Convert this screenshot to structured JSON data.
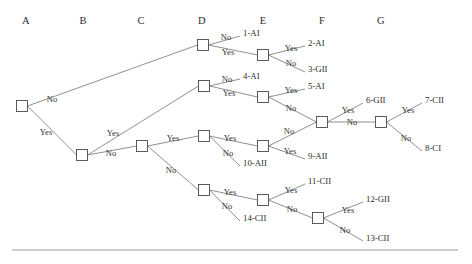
{
  "diagram": {
    "columns": [
      {
        "id": "A",
        "label": "A",
        "x": 26
      },
      {
        "id": "B",
        "label": "B",
        "x": 83
      },
      {
        "id": "C",
        "label": "C",
        "x": 141
      },
      {
        "id": "D",
        "label": "D",
        "x": 202
      },
      {
        "id": "E",
        "label": "E",
        "x": 263
      },
      {
        "id": "F",
        "label": "F",
        "x": 322
      },
      {
        "id": "G",
        "label": "G",
        "x": 381
      }
    ],
    "header_y": 22,
    "yes_label": "Yes",
    "no_label": "No",
    "nodes": [
      {
        "id": "A1",
        "column": "A",
        "x": 22,
        "y": 106
      },
      {
        "id": "B1",
        "column": "B",
        "x": 82,
        "y": 155
      },
      {
        "id": "C1",
        "column": "C",
        "x": 142,
        "y": 146
      },
      {
        "id": "D1",
        "column": "D",
        "x": 203,
        "y": 45
      },
      {
        "id": "D2",
        "column": "D",
        "x": 204,
        "y": 86
      },
      {
        "id": "D3",
        "column": "D",
        "x": 204,
        "y": 136
      },
      {
        "id": "D4",
        "column": "D",
        "x": 204,
        "y": 190
      },
      {
        "id": "E1",
        "column": "E",
        "x": 263,
        "y": 55
      },
      {
        "id": "E2",
        "column": "E",
        "x": 263,
        "y": 97
      },
      {
        "id": "E3",
        "column": "E",
        "x": 263,
        "y": 146
      },
      {
        "id": "E4",
        "column": "E",
        "x": 263,
        "y": 200
      },
      {
        "id": "F1",
        "column": "F",
        "x": 322,
        "y": 122
      },
      {
        "id": "F2",
        "column": "F",
        "x": 318,
        "y": 218
      },
      {
        "id": "G1",
        "column": "G",
        "x": 381,
        "y": 122
      }
    ],
    "node_size": 11,
    "edges": [
      {
        "from": "A1",
        "to": "D1",
        "answer": "No",
        "label_x": 52,
        "label_y": 99
      },
      {
        "from": "A1",
        "to": "B1",
        "answer": "Yes",
        "label_x": 46,
        "label_y": 132
      },
      {
        "from": "B1",
        "to": "C1",
        "answer": "Yes",
        "label_x": 113,
        "label_y": 133
      },
      {
        "from": "B1",
        "to": "D2",
        "answer": "No",
        "label_x": 111,
        "label_y": 153
      },
      {
        "from": "C1",
        "to": "D3",
        "answer": "Yes",
        "label_x": 173,
        "label_y": 138
      },
      {
        "from": "C1",
        "to": "D4",
        "answer": "No",
        "label_x": 171,
        "label_y": 170
      },
      {
        "from": "D1",
        "to": "L1",
        "answer": "No",
        "label_x": 226,
        "label_y": 37
      },
      {
        "from": "D1",
        "to": "E1",
        "answer": "Yes",
        "label_x": 228,
        "label_y": 52
      },
      {
        "from": "E1",
        "to": "L2",
        "answer": "Yes",
        "label_x": 291,
        "label_y": 48
      },
      {
        "from": "E1",
        "to": "L3",
        "answer": "No",
        "label_x": 291,
        "label_y": 63
      },
      {
        "from": "D2",
        "to": "L4",
        "answer": "No",
        "label_x": 227,
        "label_y": 79
      },
      {
        "from": "D2",
        "to": "E2",
        "answer": "Yes",
        "label_x": 229,
        "label_y": 93
      },
      {
        "from": "E2",
        "to": "L5",
        "answer": "Yes",
        "label_x": 291,
        "label_y": 90
      },
      {
        "from": "E2",
        "to": "F1",
        "answer": "No",
        "label_x": 291,
        "label_y": 108
      },
      {
        "from": "D3",
        "to": "E3",
        "answer": "Yes",
        "label_x": 230,
        "label_y": 138
      },
      {
        "from": "D3",
        "to": "L10",
        "answer": "No",
        "label_x": 228,
        "label_y": 153
      },
      {
        "from": "E3",
        "to": "F1",
        "answer": "No",
        "label_x": 289,
        "label_y": 131
      },
      {
        "from": "E3",
        "to": "L9",
        "answer": "Yes",
        "label_x": 290,
        "label_y": 151
      },
      {
        "from": "F1",
        "to": "L6",
        "answer": "Yes",
        "label_x": 348,
        "label_y": 110
      },
      {
        "from": "F1",
        "to": "G1",
        "answer": "No",
        "label_x": 352,
        "label_y": 122
      },
      {
        "from": "G1",
        "to": "L7",
        "answer": "Yes",
        "label_x": 408,
        "label_y": 110
      },
      {
        "from": "G1",
        "to": "L8",
        "answer": "No",
        "label_x": 406,
        "label_y": 138
      },
      {
        "from": "D4",
        "to": "E4",
        "answer": "Yes",
        "label_x": 230,
        "label_y": 192
      },
      {
        "from": "D4",
        "to": "L14",
        "answer": "No",
        "label_x": 227,
        "label_y": 206
      },
      {
        "from": "E4",
        "to": "L11",
        "answer": "Yes",
        "label_x": 291,
        "label_y": 190
      },
      {
        "from": "E4",
        "to": "F2",
        "answer": "No",
        "label_x": 292,
        "label_y": 209
      },
      {
        "from": "F2",
        "to": "L12",
        "answer": "Yes",
        "label_x": 348,
        "label_y": 210
      },
      {
        "from": "F2",
        "to": "L13",
        "answer": "No",
        "label_x": 345,
        "label_y": 230
      }
    ],
    "leaves": [
      {
        "id": "L1",
        "text": "1-AI",
        "x": 243,
        "y": 33
      },
      {
        "id": "L2",
        "text": "2-AI",
        "x": 308,
        "y": 43
      },
      {
        "id": "L3",
        "text": "3-GII",
        "x": 308,
        "y": 69
      },
      {
        "id": "L4",
        "text": "4-AI",
        "x": 243,
        "y": 76
      },
      {
        "id": "L5",
        "text": "5-AI",
        "x": 308,
        "y": 86
      },
      {
        "id": "L6",
        "text": "6-GII",
        "x": 366,
        "y": 100
      },
      {
        "id": "L7",
        "text": "7-CII",
        "x": 425,
        "y": 100
      },
      {
        "id": "L8",
        "text": "8-CI",
        "x": 425,
        "y": 148
      },
      {
        "id": "L9",
        "text": "9-AII",
        "x": 308,
        "y": 156
      },
      {
        "id": "L10",
        "text": "10-AII",
        "x": 243,
        "y": 163
      },
      {
        "id": "L11",
        "text": "11-CII",
        "x": 308,
        "y": 181
      },
      {
        "id": "L12",
        "text": "12-GII",
        "x": 366,
        "y": 199
      },
      {
        "id": "L13",
        "text": "13-CII",
        "x": 366,
        "y": 238
      },
      {
        "id": "L14",
        "text": "14-CII",
        "x": 243,
        "y": 218
      }
    ],
    "rules": [
      {
        "id": "bottom-rule",
        "x1": 12,
        "y1": 250,
        "x2": 458,
        "y2": 250
      }
    ]
  }
}
